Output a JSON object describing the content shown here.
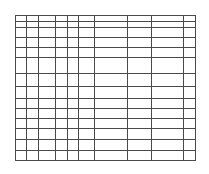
{
  "table": {
    "description": "Empty ruled table grid with no cell content",
    "line_color": "#4a4a4a",
    "background_color": "#ffffff",
    "bounds": {
      "left": 15,
      "top": 15,
      "right": 195,
      "bottom": 160
    },
    "column_lines_x": [
      15,
      26,
      38,
      55,
      67,
      78,
      94,
      127,
      151,
      183,
      195
    ],
    "row_lines_y": [
      15,
      21,
      27,
      37,
      47,
      57,
      73,
      86,
      98,
      108,
      118,
      128,
      139,
      150,
      160
    ],
    "columns": 10,
    "rows": 14,
    "cells": []
  }
}
